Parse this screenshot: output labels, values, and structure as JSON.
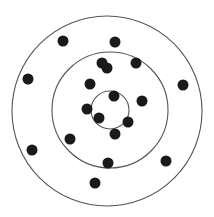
{
  "diagram": {
    "type": "concentric-circles-with-points",
    "background": "#ffffff",
    "stroke_color": "#555555",
    "dot_color": "#1a1a1a",
    "dot_radius": 5.5,
    "circles": [
      {
        "name": "outer-circle",
        "cx": 107,
        "cy": 111,
        "r": 95
      },
      {
        "name": "middle-circle",
        "cx": 110,
        "cy": 110,
        "r": 58
      },
      {
        "name": "inner-circle",
        "cx": 110,
        "cy": 110,
        "r": 19
      }
    ],
    "points": [
      {
        "x": 63,
        "y": 41
      },
      {
        "x": 115,
        "y": 42
      },
      {
        "x": 28,
        "y": 79
      },
      {
        "x": 183,
        "y": 85
      },
      {
        "x": 102,
        "y": 63
      },
      {
        "x": 136,
        "y": 63
      },
      {
        "x": 90,
        "y": 84
      },
      {
        "x": 107,
        "y": 68
      },
      {
        "x": 114,
        "y": 96
      },
      {
        "x": 142,
        "y": 101
      },
      {
        "x": 87,
        "y": 109
      },
      {
        "x": 99,
        "y": 118
      },
      {
        "x": 128,
        "y": 122
      },
      {
        "x": 115,
        "y": 134
      },
      {
        "x": 70,
        "y": 139
      },
      {
        "x": 32,
        "y": 150
      },
      {
        "x": 166,
        "y": 161
      },
      {
        "x": 108,
        "y": 163
      },
      {
        "x": 95,
        "y": 183
      }
    ]
  }
}
